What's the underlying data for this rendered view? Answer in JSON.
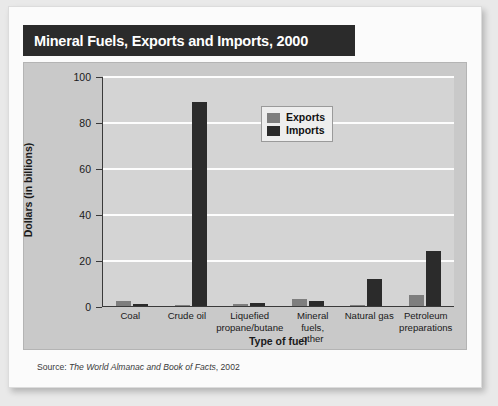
{
  "title": "Mineral Fuels, Exports and Imports, 2000",
  "source": {
    "prefix": "Source:",
    "publication": "The World Almanac and Book of Facts",
    "year": ", 2002"
  },
  "chart_data": {
    "type": "bar",
    "title": "Mineral Fuels, Exports and Imports, 2000",
    "xlabel": "Type of fuel",
    "ylabel": "Dollars (in billions)",
    "ylim": [
      0,
      100
    ],
    "yticks": [
      "0",
      "20",
      "40",
      "60",
      "80",
      "100"
    ],
    "grid": true,
    "legend_position": "top-center-right",
    "categories": [
      "Coal",
      "Crude oil",
      "Liquefied propane/butane",
      "Mineral fuels, other",
      "Natural gas",
      "Petroleum preparations"
    ],
    "category_lines": [
      [
        "Coal"
      ],
      [
        "Crude oil"
      ],
      [
        "Liquefied",
        "propane/butane"
      ],
      [
        "Mineral fuels,",
        "other"
      ],
      [
        "Natural gas"
      ],
      [
        "Petroleum",
        "preparations"
      ]
    ],
    "series": [
      {
        "name": "Exports",
        "color": "#7e7e7e",
        "values": [
          2,
          0.4,
          1,
          3,
          0.6,
          5
        ]
      },
      {
        "name": "Imports",
        "color": "#2b2b2b",
        "values": [
          1,
          89,
          1.3,
          2,
          12,
          24
        ]
      }
    ]
  }
}
